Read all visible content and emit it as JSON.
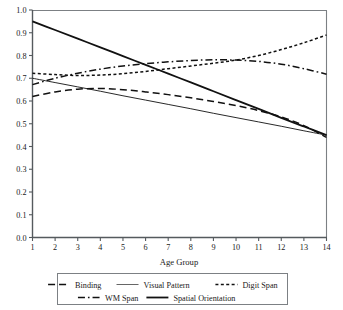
{
  "chart_data": {
    "type": "line",
    "title": "",
    "xlabel": "Age Group",
    "ylabel": "",
    "xlim": [
      1,
      14
    ],
    "ylim": [
      0.0,
      1.0
    ],
    "grid": false,
    "legend_position": "bottom",
    "x": [
      1,
      2,
      3,
      4,
      5,
      6,
      7,
      8,
      9,
      10,
      11,
      12,
      13,
      14
    ],
    "xticklabels": [
      "1",
      "2",
      "3",
      "4",
      "5",
      "6",
      "7",
      "8",
      "9",
      "10",
      "11",
      "12",
      "13",
      "14"
    ],
    "yticklabels": [
      "0.0",
      "0.1",
      "0.2",
      "0.3",
      "0.4",
      "0.5",
      "0.6",
      "0.7",
      "0.8",
      "0.9",
      "1.0"
    ],
    "yticks": [
      0.0,
      0.1,
      0.2,
      0.3,
      0.4,
      0.5,
      0.6,
      0.7,
      0.8,
      0.9,
      1.0
    ],
    "series": [
      {
        "name": "Binding",
        "style": "long-dash",
        "dasharray": "7,4",
        "width": 1.5,
        "color": "#111111",
        "values": [
          0.62,
          0.64,
          0.652,
          0.655,
          0.65,
          0.64,
          0.628,
          0.614,
          0.598,
          0.58,
          0.558,
          0.53,
          0.492,
          0.44
        ]
      },
      {
        "name": "Visual Pattern",
        "style": "solid-thin",
        "dasharray": "",
        "width": 0.9,
        "color": "#555555",
        "values": [
          0.7,
          0.681,
          0.662,
          0.643,
          0.623,
          0.604,
          0.585,
          0.566,
          0.546,
          0.527,
          0.508,
          0.489,
          0.469,
          0.45
        ]
      },
      {
        "name": "Digit Span",
        "style": "dotted",
        "dasharray": "3,2.4",
        "width": 1.5,
        "color": "#111111",
        "values": [
          0.722,
          0.716,
          0.712,
          0.714,
          0.72,
          0.73,
          0.742,
          0.754,
          0.766,
          0.78,
          0.8,
          0.826,
          0.856,
          0.89
        ]
      },
      {
        "name": "WM Span",
        "style": "dash-dot",
        "dasharray": "7,3,1.6,3",
        "width": 1.5,
        "color": "#111111",
        "values": [
          0.672,
          0.7,
          0.722,
          0.74,
          0.754,
          0.764,
          0.772,
          0.778,
          0.781,
          0.78,
          0.774,
          0.762,
          0.742,
          0.718
        ]
      },
      {
        "name": "Spatial Orientation",
        "style": "solid",
        "dasharray": "",
        "width": 1.8,
        "color": "#111111",
        "values": [
          0.95,
          0.912,
          0.874,
          0.836,
          0.797,
          0.759,
          0.72,
          0.682,
          0.643,
          0.604,
          0.565,
          0.526,
          0.488,
          0.45
        ]
      }
    ],
    "legend_rows": [
      [
        "Binding",
        "Visual Pattern",
        "Digit Span"
      ],
      [
        "WM Span",
        "Spatial Orientation"
      ]
    ]
  }
}
